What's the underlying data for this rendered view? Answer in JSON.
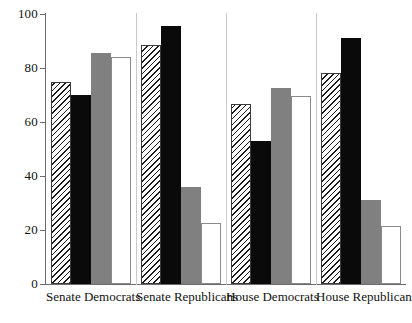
{
  "chart_data": {
    "type": "bar",
    "title": "",
    "xlabel": "",
    "ylabel": "",
    "ylim": [
      0,
      100
    ],
    "yticks": [
      0,
      20,
      40,
      60,
      80,
      100
    ],
    "ytick_labels": [
      "0",
      "20",
      "40",
      "60",
      "80",
      "100"
    ],
    "grid": false,
    "legend": "none",
    "categories": [
      "Senate Democrats",
      "Senate Republicans",
      "House Democrats",
      "House Republicans"
    ],
    "series": [
      {
        "name": "series-1",
        "style": "diagonal-hatch",
        "color": "#ffffff",
        "values": [
          75,
          88.5,
          66.5,
          78
        ]
      },
      {
        "name": "series-2",
        "style": "solid-black",
        "color": "#0a0a0a",
        "values": [
          70,
          95.5,
          53,
          91
        ]
      },
      {
        "name": "series-3",
        "style": "solid-gray",
        "color": "#808080",
        "values": [
          85.5,
          36,
          72.5,
          31
        ]
      },
      {
        "name": "series-4",
        "style": "outline-white",
        "color": "#ffffff",
        "values": [
          84,
          22.5,
          69.5,
          21.5
        ]
      }
    ]
  },
  "axis": {
    "y_tick_labels": [
      "100",
      "80",
      "60",
      "40",
      "20",
      "0"
    ]
  },
  "clipped_title": ""
}
